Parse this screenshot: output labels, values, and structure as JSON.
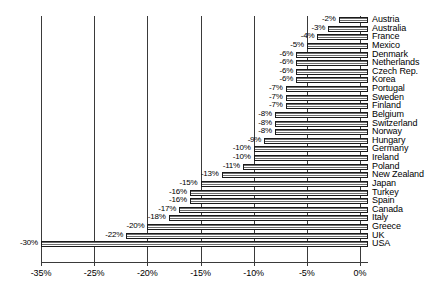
{
  "chart_data": {
    "type": "bar",
    "orientation": "horizontal",
    "title": "",
    "subtitle": "",
    "xlabel": "",
    "ylabel": "",
    "xlim": [
      -33.0,
      0.6
    ],
    "grid": true,
    "legend": "none",
    "value_suffix": "%",
    "axis_ticks": [
      {
        "label": "-35%",
        "value": -30
      },
      {
        "label": "-25%",
        "value": -25
      },
      {
        "label": "-20%",
        "value": -20
      },
      {
        "label": "-15%",
        "value": -15
      },
      {
        "label": "-10%",
        "value": -10
      },
      {
        "label": "-5%",
        "value": -5
      },
      {
        "label": "0%",
        "value": 0
      }
    ],
    "categories": [
      "Austria",
      "Australia",
      "France",
      "Mexico",
      "Denmark",
      "Netherlands",
      "Czech Rep.",
      "Korea",
      "Portugal",
      "Sweden",
      "Finland",
      "Belgium",
      "Switzerland",
      "Norway",
      "Hungary",
      "Germany",
      "Ireland",
      "Poland",
      "New Zealand",
      "Japan",
      "Turkey",
      "Spain",
      "Canada",
      "Italy",
      "Greece",
      "UK",
      "USA"
    ],
    "values": [
      -2,
      -3,
      -4,
      -5,
      -6,
      -6,
      -6,
      -6,
      -7,
      -7,
      -7,
      -8,
      -8,
      -8,
      -9,
      -10,
      -10,
      -11,
      -13,
      -15,
      -16,
      -16,
      -17,
      -18,
      -20,
      -22,
      -30
    ],
    "value_labels": [
      "-2%",
      "-3%",
      "-4%",
      "-5%",
      "-6%",
      "-6%",
      "-6%",
      "-6%",
      "-7%",
      "-7%",
      "-7%",
      "-8%",
      "-8%",
      "-8%",
      "-9%",
      "-10%",
      "-10%",
      "-11%",
      "-13%",
      "-15%",
      "-16%",
      "-16%",
      "-17%",
      "-18%",
      "-20%",
      "-22%",
      "-30%"
    ],
    "colors": {
      "bar_fill": "#b9b9b9",
      "bar_hatch": "#6f6f6f",
      "bar_edge": "#1a1a1a",
      "gridline": "#3a3a3a",
      "text": "#000000",
      "background": "#ffffff"
    }
  }
}
